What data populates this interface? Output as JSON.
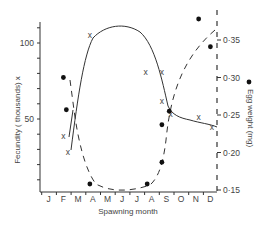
{
  "chart_data": {
    "type": "scatter",
    "title": "",
    "xlabel": "Spawning month",
    "ylabel_left": "Fecundity ( thousands) x",
    "ylabel_right": "Egg weight (mg)",
    "categories": [
      "J",
      "F",
      "M",
      "A",
      "M",
      "J",
      "J",
      "A",
      "S",
      "O",
      "N",
      "D"
    ],
    "left_axis": {
      "ticks": [
        {
          "value": 50,
          "label": "50"
        },
        {
          "value": 100,
          "label": "100"
        }
      ],
      "ylim": [
        0,
        115
      ]
    },
    "right_axis": {
      "ticks": [
        {
          "value": 0.15,
          "label": "0·15"
        },
        {
          "value": 0.2,
          "label": "0·20"
        },
        {
          "value": 0.25,
          "label": "0·25"
        },
        {
          "value": 0.3,
          "label": "0·30"
        },
        {
          "value": 0.35,
          "label": "0·35"
        }
      ],
      "ylim": [
        0.15,
        0.38
      ]
    },
    "grid": false,
    "series": [
      {
        "name": "Fecundity (thousands)",
        "marker": "x",
        "axis": "left",
        "line": "solid",
        "points": [
          {
            "month": 2.0,
            "value": 39
          },
          {
            "month": 2.3,
            "value": 28
          },
          {
            "month": 3.8,
            "value": 105
          },
          {
            "month": 7.6,
            "value": 81
          },
          {
            "month": 8.7,
            "value": 81
          },
          {
            "month": 8.7,
            "value": 62
          },
          {
            "month": 9.3,
            "value": 53
          },
          {
            "month": 11.2,
            "value": 51
          },
          {
            "month": 12.1,
            "value": 45
          }
        ]
      },
      {
        "name": "Egg weight (mg)",
        "marker": "dot",
        "axis": "right",
        "line": "dashed",
        "points": [
          {
            "month": 2.0,
            "value": 0.3
          },
          {
            "month": 2.2,
            "value": 0.257
          },
          {
            "month": 3.8,
            "value": 0.158
          },
          {
            "month": 7.7,
            "value": 0.158
          },
          {
            "month": 8.7,
            "value": 0.187
          },
          {
            "month": 8.7,
            "value": 0.237
          },
          {
            "month": 9.2,
            "value": 0.255
          },
          {
            "month": 11.2,
            "value": 0.378
          },
          {
            "month": 12.0,
            "value": 0.341
          }
        ]
      }
    ]
  }
}
